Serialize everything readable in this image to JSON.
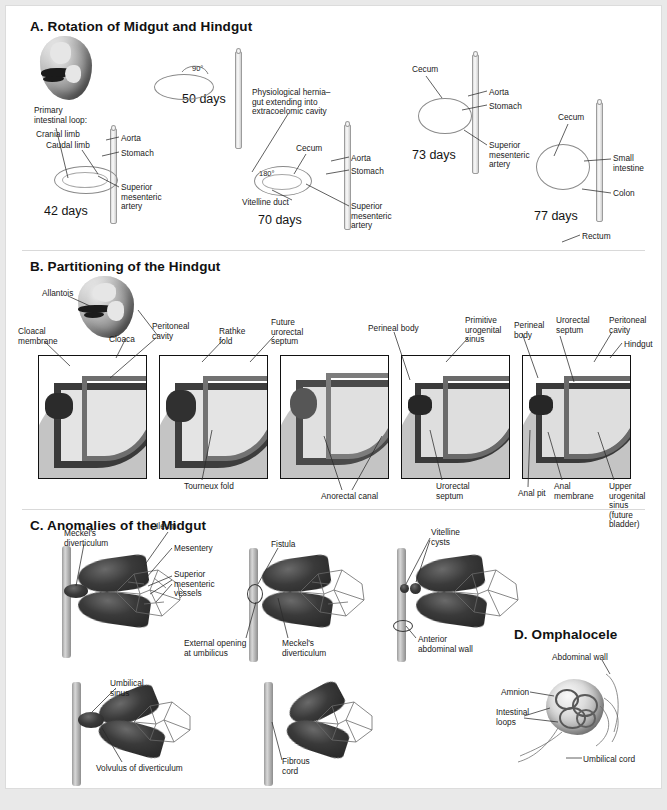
{
  "figure": {
    "background_color": "#e9e9e9",
    "card_color": "#ffffff",
    "ink_color": "#1a1a1a"
  },
  "panels": [
    {
      "id": "A",
      "title": "A.  Rotation of Midgut and Hindgut",
      "stages": [
        {
          "day_label": "42 days",
          "rotation": "",
          "labels": [
            "Primary\nintestinal loop:",
            "Cranial limb",
            "Caudal limb",
            "Aorta",
            "Stomach",
            "Superior\nmesenteric\nartery"
          ]
        },
        {
          "day_label": "50 days",
          "rotation": "90°",
          "labels": []
        },
        {
          "day_label": "70 days",
          "rotation": "180°",
          "labels": [
            "Physiological hernia–\ngut extending into\nextracoelomic cavity",
            "Vitelline duct",
            "Cecum",
            "Aorta",
            "Stomach",
            "Superior\nmesenteric\nartery"
          ]
        },
        {
          "day_label": "73 days",
          "rotation": "",
          "labels": [
            "Cecum",
            "Aorta",
            "Stomach",
            "Superior\nmesenteric\nartery"
          ]
        },
        {
          "day_label": "77 days",
          "rotation": "",
          "labels": [
            "Cecum",
            "Small\nintestine",
            "Colon",
            "Rectum"
          ]
        }
      ]
    },
    {
      "id": "B",
      "title": "B.  Partitioning of the Hindgut",
      "labels_top": [
        "Allantois",
        "Cloacal\nmembrane",
        "Cloaca",
        "Peritoneal\ncavity",
        "Rathke\nfold",
        "Future\nurorectal\nseptum",
        "Perineal body",
        "Primitive\nurogenital\nsinus",
        "Perineal\nbody",
        "Urorectal\nseptum",
        "Peritoneal\ncavity",
        "Hindgut"
      ],
      "labels_bottom": [
        "Tourneux fold",
        "Anorectal canal",
        "Urorectal\nseptum",
        "Anal pit",
        "Anal\nmembrane",
        "Upper\nurogenital\nsinus\n(future\nbladder)"
      ]
    },
    {
      "id": "C",
      "title": "C.  Anomalies of the Midgut",
      "figures": [
        {
          "name": "meckels-diverticulum",
          "labels": [
            "Meckel's\ndiverticulum",
            "Ileum",
            "Mesentery",
            "Superior\nmesenteric\nvessels"
          ]
        },
        {
          "name": "fistula",
          "labels": [
            "Fistula",
            "External opening\nat umbilicus",
            "Meckel's\ndiverticulum"
          ]
        },
        {
          "name": "vitelline-cysts",
          "labels": [
            "Vitelline\ncysts",
            "Anterior\nabdominal wall"
          ]
        },
        {
          "name": "umbilical-sinus",
          "labels": [
            "Umbilical\nsinus",
            "Volvulus of diverticulum"
          ]
        },
        {
          "name": "fibrous-cord",
          "labels": [
            "Fibrous\ncord"
          ]
        }
      ]
    },
    {
      "id": "D",
      "title": "D.  Omphalocele",
      "labels": [
        "Abdominal wall",
        "Amnion",
        "Intestinal\nloops",
        "Umbilical cord"
      ]
    }
  ],
  "textA": {
    "title": "A.  Rotation of Midgut and Hindgut",
    "primary_loop": "Primary\nintestinal loop:",
    "cranial_limb": "Cranial limb",
    "caudal_limb": "Caudal limb",
    "aorta1": "Aorta",
    "stomach1": "Stomach",
    "sma1": "Superior\nmesenteric\nartery",
    "d42": "42 days",
    "rot90": "90°",
    "d50": "50 days",
    "hernia": "Physiological hernia–\ngut extending into\nextracoelomic cavity",
    "rot180": "180°",
    "vitelline_duct": "Vitelline duct",
    "d70": "70 days",
    "cecum70": "Cecum",
    "aorta2": "Aorta",
    "stomach2": "Stomach",
    "sma2": "Superior\nmesenteric\nartery",
    "cecum73": "Cecum",
    "aorta3": "Aorta",
    "stomach3": "Stomach",
    "sma3": "Superior\nmesenteric\nartery",
    "d73": "73 days",
    "cecum77": "Cecum",
    "small_intestine": "Small\nintestine",
    "colon": "Colon",
    "d77": "77 days",
    "rectum": "Rectum"
  },
  "textB": {
    "title": "B.  Partitioning of the Hindgut",
    "allantois": "Allantois",
    "cloacal_membrane": "Cloacal\nmembrane",
    "cloaca": "Cloaca",
    "peritoneal_cavity": "Peritoneal\ncavity",
    "rathke_fold": "Rathke\nfold",
    "future_urorectal_septum": "Future\nurorectal\nseptum",
    "perineal_body": "Perineal body",
    "primitive_urogenital_sinus": "Primitive\nurogenital\nsinus",
    "perineal_body2": "Perineal\nbody",
    "urorectal_septum_top": "Urorectal\nseptum",
    "peritoneal_cavity2": "Peritoneal\ncavity",
    "hindgut": "Hindgut",
    "tourneux_fold": "Tourneux fold",
    "anorectal_canal": "Anorectal canal",
    "urorectal_septum_bot": "Urorectal\nseptum",
    "anal_pit": "Anal pit",
    "anal_membrane": "Anal\nmembrane",
    "upper_urogenital_sinus": "Upper\nurogenital\nsinus\n(future\nbladder)"
  },
  "textC": {
    "title": "C.  Anomalies of the Midgut",
    "meckels": "Meckel's\ndiverticulum",
    "ileum": "Ileum",
    "mesentery": "Mesentery",
    "smv": "Superior\nmesenteric\nvessels",
    "fistula": "Fistula",
    "external_opening": "External opening\nat umbilicus",
    "meckels2": "Meckel's\ndiverticulum",
    "vitelline_cysts": "Vitelline\ncysts",
    "anterior_wall": "Anterior\nabdominal wall",
    "umbilical_sinus": "Umbilical\nsinus",
    "volvulus": "Volvulus of diverticulum",
    "fibrous_cord": "Fibrous\ncord"
  },
  "textD": {
    "title": "D.  Omphalocele",
    "abdominal_wall": "Abdominal wall",
    "amnion": "Amnion",
    "intestinal_loops": "Intestinal\nloops",
    "umbilical_cord": "Umbilical cord"
  }
}
